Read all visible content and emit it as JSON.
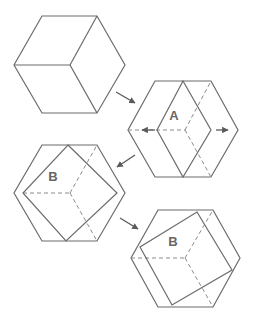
{
  "colors": {
    "line": "#6b6b6b",
    "dashed": "#8a8a8a",
    "arrow": "#5a5a5a",
    "label": "#666666",
    "background": "#ffffff"
  },
  "panels": [
    {
      "id": "step-1",
      "hexagon": [
        [
          42,
          16
        ],
        [
          97,
          16
        ],
        [
          125,
          65
        ],
        [
          97,
          113
        ],
        [
          42,
          113
        ],
        [
          14,
          65
        ]
      ],
      "solid_lines": [
        [
          [
            70,
            65
          ],
          [
            14,
            65
          ]
        ],
        [
          [
            70,
            65
          ],
          [
            97,
            16
          ]
        ],
        [
          [
            70,
            65
          ],
          [
            97,
            113
          ]
        ]
      ],
      "dashed_lines": [],
      "shape": null,
      "label": null
    },
    {
      "id": "step-2",
      "hexagon": [
        [
          155,
          81
        ],
        [
          211,
          81
        ],
        [
          238,
          130
        ],
        [
          211,
          177
        ],
        [
          155,
          177
        ],
        [
          128,
          130
        ]
      ],
      "solid_lines": [],
      "dashed_lines": [
        [
          [
            128,
            130
          ],
          [
            185,
            130
          ]
        ],
        [
          [
            185,
            130
          ],
          [
            211,
            81
          ]
        ],
        [
          [
            185,
            130
          ],
          [
            211,
            177
          ]
        ]
      ],
      "shape": [
        [
          183,
          81
        ],
        [
          211,
          130
        ],
        [
          183,
          177
        ],
        [
          157,
          130
        ]
      ],
      "label": {
        "text": "A",
        "x": 174,
        "y": 120
      },
      "arrows": [
        {
          "from": [
            155,
            130
          ],
          "to": [
            142,
            130
          ]
        },
        {
          "from": [
            216,
            130
          ],
          "to": [
            228,
            130
          ]
        }
      ]
    },
    {
      "id": "step-3",
      "hexagon": [
        [
          42,
          145
        ],
        [
          97,
          145
        ],
        [
          125,
          193
        ],
        [
          97,
          241
        ],
        [
          42,
          241
        ],
        [
          14,
          193
        ]
      ],
      "solid_lines": [],
      "dashed_lines": [
        [
          [
            23,
            193
          ],
          [
            70,
            193
          ]
        ],
        [
          [
            70,
            193
          ],
          [
            97,
            145
          ]
        ],
        [
          [
            70,
            193
          ],
          [
            97,
            241
          ]
        ]
      ],
      "shape": [
        [
          68,
          145
        ],
        [
          117,
          193
        ],
        [
          66,
          241
        ],
        [
          23,
          193
        ]
      ],
      "label": {
        "text": "B",
        "x": 53,
        "y": 181
      }
    },
    {
      "id": "step-4",
      "hexagon": [
        [
          158,
          210
        ],
        [
          213,
          210
        ],
        [
          240,
          258
        ],
        [
          213,
          307
        ],
        [
          158,
          307
        ],
        [
          131,
          258
        ]
      ],
      "solid_lines": [],
      "dashed_lines": [
        [
          [
            131,
            258
          ],
          [
            185,
            258
          ]
        ],
        [
          [
            185,
            258
          ],
          [
            213,
            210
          ]
        ],
        [
          [
            185,
            258
          ],
          [
            213,
            307
          ]
        ]
      ],
      "shape": [
        [
          197,
          212
        ],
        [
          232,
          270
        ],
        [
          172,
          305
        ],
        [
          140,
          247
        ]
      ],
      "label": {
        "text": "B",
        "x": 173,
        "y": 246
      }
    }
  ],
  "transition_arrows": [
    {
      "from": [
        116,
        92
      ],
      "to": [
        135,
        103
      ]
    },
    {
      "from": [
        135,
        155
      ],
      "to": [
        117,
        167
      ]
    },
    {
      "from": [
        120,
        218
      ],
      "to": [
        138,
        229
      ]
    }
  ]
}
